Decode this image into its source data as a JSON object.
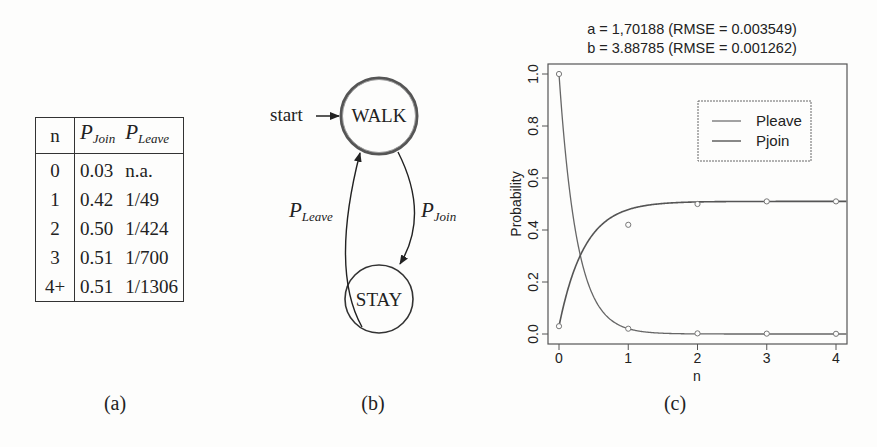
{
  "figure_a": {
    "caption": "(a)",
    "table": {
      "headers": {
        "n": "n",
        "p_join": {
          "base": "P",
          "sub": "Join"
        },
        "p_leave": {
          "base": "P",
          "sub": "Leave"
        }
      },
      "rows": [
        {
          "n": "0",
          "p_join": "0.03",
          "p_leave": "n.a."
        },
        {
          "n": "1",
          "p_join": "0.42",
          "p_leave": "1/49"
        },
        {
          "n": "2",
          "p_join": "0.50",
          "p_leave": "1/424"
        },
        {
          "n": "3",
          "p_join": "0.51",
          "p_leave": "1/700"
        },
        {
          "n": "4+",
          "p_join": "0.51",
          "p_leave": "1/1306"
        }
      ]
    }
  },
  "figure_b": {
    "caption": "(b)",
    "start_label": "start",
    "states": {
      "walk": "WALK",
      "stay": "STAY"
    },
    "edges": {
      "leave": {
        "base": "P",
        "sub": "Leave"
      },
      "join": {
        "base": "P",
        "sub": "Join"
      }
    }
  },
  "figure_c": {
    "caption": "(c)",
    "title_line1": "a = 1,70188 (RMSE = 0.003549)",
    "title_line2": "b = 3.88785 (RMSE = 0.001262)",
    "xlabel": "n",
    "ylabel": "Probability",
    "xticks": [
      "0",
      "1",
      "2",
      "3",
      "4"
    ],
    "yticks": [
      "0.0",
      "0.2",
      "0.4",
      "0.6",
      "0.8",
      "1.0"
    ],
    "legend": [
      "Pleave",
      "Pjoin"
    ]
  },
  "chart_data": {
    "type": "line",
    "xlabel": "n",
    "ylabel": "Probability",
    "x": [
      0,
      1,
      2,
      3,
      4
    ],
    "series": [
      {
        "name": "Pleave",
        "values": [
          1.0,
          0.0204,
          0.0024,
          0.0014,
          0.0008
        ],
        "fit": "exponential decay"
      },
      {
        "name": "Pjoin",
        "values": [
          0.03,
          0.42,
          0.5,
          0.51,
          0.51
        ],
        "fit": "saturating exponential"
      }
    ],
    "xlim": [
      -0.15,
      4.15
    ],
    "ylim": [
      -0.04,
      1.04
    ],
    "legend_position": "upper right",
    "grid": false,
    "markers": "open circles at data points"
  },
  "colors": {
    "ink": "#222222",
    "plot_line": "#555555",
    "background": "#fdfdfc"
  }
}
